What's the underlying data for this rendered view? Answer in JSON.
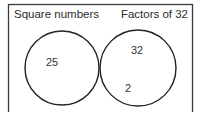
{
  "diagram": {
    "type": "venn",
    "frame": {
      "stroke": "#3a3a3a"
    },
    "sets": [
      {
        "id": "left",
        "label": "Square numbers",
        "cx": 62,
        "cy": 68,
        "r": 37
      },
      {
        "id": "right",
        "label": "Factors of 32",
        "cx": 138,
        "cy": 68,
        "r": 38
      }
    ],
    "intersection": {
      "fill": "#c9c9c9",
      "values": []
    },
    "regions": {
      "left_only": [
        {
          "value": "25",
          "x": 52,
          "y": 62
        }
      ],
      "right_only": [
        {
          "value": "32",
          "x": 137,
          "y": 50
        },
        {
          "value": "2",
          "x": 128,
          "y": 88
        }
      ]
    },
    "colors": {
      "stroke": "#222222",
      "shade": "#c9c9c9",
      "text": "#2b2b2b",
      "background": "#ffffff"
    }
  }
}
